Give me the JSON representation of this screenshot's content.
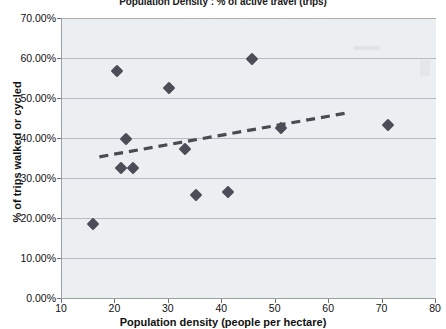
{
  "chart_data": {
    "type": "scatter",
    "title": "Population Density : % of active travel (trips)",
    "xlabel": "Population density (people per hectare)",
    "ylabel": "% of trips walked or cycled",
    "xlim": [
      10,
      80
    ],
    "ylim": [
      0,
      0.7
    ],
    "grid": true,
    "legend": "none",
    "x_ticks": [
      "10",
      "20",
      "30",
      "40",
      "50",
      "60",
      "70",
      "80"
    ],
    "x_tick_values": [
      10,
      20,
      30,
      40,
      50,
      60,
      70,
      80
    ],
    "y_ticks": [
      "0.00%",
      "10.00%",
      "20.00%",
      "30.00%",
      "40.00%",
      "50.00%",
      "60.00%",
      "70.00%"
    ],
    "y_tick_values": [
      0,
      10,
      20,
      30,
      40,
      50,
      60,
      70
    ],
    "series": [
      {
        "name": "local authority areas",
        "marker": "diamond",
        "color": "#4d4d57",
        "points": [
          {
            "x": 15.8,
            "y": 18.6
          },
          {
            "x": 20.3,
            "y": 56.7
          },
          {
            "x": 21.0,
            "y": 32.5
          },
          {
            "x": 22.0,
            "y": 39.8
          },
          {
            "x": 23.2,
            "y": 32.5
          },
          {
            "x": 30.0,
            "y": 52.5
          },
          {
            "x": 33.0,
            "y": 37.3
          },
          {
            "x": 35.0,
            "y": 25.8
          },
          {
            "x": 41.0,
            "y": 26.5
          },
          {
            "x": 45.5,
            "y": 59.7
          },
          {
            "x": 51.0,
            "y": 42.5
          },
          {
            "x": 71.0,
            "y": 43.3
          }
        ]
      }
    ],
    "trendline": {
      "style": "dashed",
      "color": "#4a4a52",
      "x_start": 17.0,
      "y_start": 35.3,
      "x_end": 63.5,
      "y_end": 46.3
    }
  },
  "colors": {
    "plot_background": "#eceff1",
    "gridline": "#b6bcc2",
    "axis": "#9aa0a6",
    "marker": "#4d4d57",
    "trendline": "#4a4a52",
    "text": "#111111"
  }
}
